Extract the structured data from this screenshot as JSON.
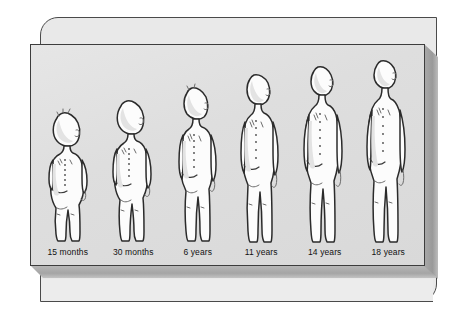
{
  "illustration": {
    "title": "Human growth and posture development sequence",
    "description": "Six nude child figures shown in posterior-oblique view illustrating changes in body proportion and spinal posture with age",
    "panel_background_color": "#dedede",
    "frame_color": "#e9e9e9",
    "outline_color": "#2b2b2b",
    "figure_fill_color": "#fcfcfc",
    "figures": [
      {
        "id": "figure-1",
        "label": "15 months",
        "age_value": 15,
        "age_unit": "months",
        "relative_height": 0.62,
        "head_ratio": "large"
      },
      {
        "id": "figure-2",
        "label": "30 months",
        "age_value": 30,
        "age_unit": "months",
        "relative_height": 0.7,
        "head_ratio": "large"
      },
      {
        "id": "figure-3",
        "label": "6 years",
        "age_value": 6,
        "age_unit": "years",
        "relative_height": 0.8,
        "head_ratio": "medium"
      },
      {
        "id": "figure-4",
        "label": "11 years",
        "age_value": 11,
        "age_unit": "years",
        "relative_height": 0.9,
        "head_ratio": "medium"
      },
      {
        "id": "figure-5",
        "label": "14 years",
        "age_value": 14,
        "age_unit": "years",
        "relative_height": 0.95,
        "head_ratio": "small"
      },
      {
        "id": "figure-6",
        "label": "18 years",
        "age_value": 18,
        "age_unit": "years",
        "relative_height": 1.0,
        "head_ratio": "small"
      }
    ]
  }
}
